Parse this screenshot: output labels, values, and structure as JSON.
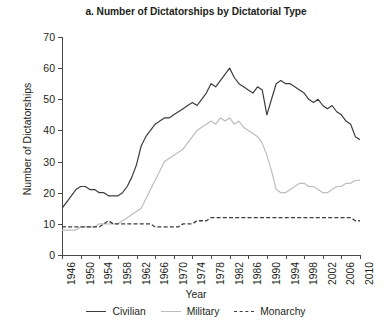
{
  "chart_data": {
    "type": "line",
    "title": "a. Number of Dictatorships by Dictatorial Type",
    "xlabel": "Year",
    "ylabel": "Number of Dictatorships",
    "xlim": [
      1946,
      2010
    ],
    "ylim": [
      0,
      70
    ],
    "ytick_labels": [
      "0",
      "10",
      "20",
      "30",
      "40",
      "50",
      "60",
      "70"
    ],
    "ytick_values": [
      0,
      10,
      20,
      30,
      40,
      50,
      60,
      70
    ],
    "xtick_labels": [
      "1946",
      "1950",
      "1954",
      "1958",
      "1962",
      "1966",
      "1970",
      "1974",
      "1978",
      "1982",
      "1986",
      "1990",
      "1994",
      "1998",
      "2002",
      "2006",
      "2010"
    ],
    "xtick_values": [
      1946,
      1950,
      1954,
      1958,
      1962,
      1966,
      1970,
      1974,
      1978,
      1982,
      1986,
      1990,
      1994,
      1998,
      2002,
      2006,
      2010
    ],
    "grid": false,
    "legend_position": "bottom",
    "x": [
      1946,
      1947,
      1948,
      1949,
      1950,
      1951,
      1952,
      1953,
      1954,
      1955,
      1956,
      1957,
      1958,
      1959,
      1960,
      1961,
      1962,
      1963,
      1964,
      1965,
      1966,
      1967,
      1968,
      1969,
      1970,
      1971,
      1972,
      1973,
      1974,
      1975,
      1976,
      1977,
      1978,
      1979,
      1980,
      1981,
      1982,
      1983,
      1984,
      1985,
      1986,
      1987,
      1988,
      1989,
      1990,
      1991,
      1992,
      1993,
      1994,
      1995,
      1996,
      1997,
      1998,
      1999,
      2000,
      2001,
      2002,
      2003,
      2004,
      2005,
      2006,
      2007,
      2008,
      2009,
      2010
    ],
    "series": [
      {
        "name": "Civilian",
        "color": "#3d3d3d",
        "style": "solid",
        "values": [
          15,
          17,
          19,
          21,
          22,
          22,
          21,
          21,
          20,
          20,
          19,
          19,
          19,
          20,
          22,
          25,
          29,
          35,
          38,
          40,
          42,
          43,
          44,
          44,
          45,
          46,
          47,
          48,
          49,
          48,
          50,
          52,
          55,
          54,
          56,
          58,
          60,
          57,
          55,
          54,
          53,
          52,
          54,
          53,
          45,
          50,
          55,
          56,
          55,
          55,
          54,
          53,
          52,
          50,
          49,
          50,
          48,
          47,
          48,
          46,
          45,
          43,
          42,
          38,
          37
        ]
      },
      {
        "name": "Military",
        "color": "#bdbdbd",
        "style": "solid",
        "values": [
          8,
          8,
          8,
          8,
          9,
          9,
          9,
          9,
          10,
          10,
          10,
          10,
          10,
          11,
          12,
          13,
          14,
          15,
          18,
          21,
          24,
          27,
          30,
          31,
          32,
          33,
          34,
          36,
          38,
          40,
          41,
          42,
          43,
          42,
          44,
          43,
          44,
          42,
          43,
          41,
          40,
          39,
          38,
          36,
          32,
          27,
          21,
          20,
          20,
          21,
          22,
          23,
          23,
          22,
          22,
          21,
          20,
          20,
          21,
          22,
          22,
          23,
          23,
          24,
          24
        ]
      },
      {
        "name": "Monarchy",
        "color": "#3d3d3d",
        "style": "dashed",
        "values": [
          9,
          9,
          9,
          9,
          9,
          9,
          9,
          9,
          9,
          10,
          11,
          10,
          10,
          10,
          10,
          10,
          10,
          10,
          10,
          10,
          9,
          9,
          9,
          9,
          9,
          9,
          10,
          10,
          10,
          11,
          11,
          11,
          12,
          12,
          12,
          12,
          12,
          12,
          12,
          12,
          12,
          12,
          12,
          12,
          12,
          12,
          12,
          12,
          12,
          12,
          12,
          12,
          12,
          12,
          12,
          12,
          12,
          12,
          12,
          12,
          12,
          12,
          12,
          11,
          11
        ]
      }
    ]
  },
  "legend": {
    "items": [
      {
        "label": "Civilian"
      },
      {
        "label": "Military"
      },
      {
        "label": "Monarchy"
      }
    ]
  }
}
